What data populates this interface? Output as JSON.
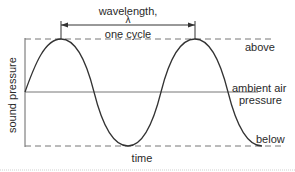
{
  "diagram": {
    "labels": {
      "wavelength": "wavelength,",
      "lambda": "λ",
      "one_cycle": "one cycle",
      "above": "above",
      "ambient_line1": "ambient air",
      "ambient_line2": "pressure",
      "below": "below",
      "y_axis": "sound pressure",
      "x_axis": "time"
    },
    "colors": {
      "curve": "#333333",
      "axis": "#666666",
      "dashed": "#777777",
      "ambient": "#777777",
      "text": "#2a2a2a"
    }
  }
}
